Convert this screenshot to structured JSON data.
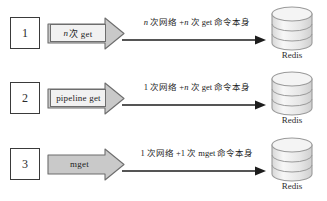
{
  "diagram": {
    "db_label": "Redis",
    "colors": {
      "arrow_fill": "#c9c9c9",
      "arrow_stroke": "#6d6d6d",
      "cylinder_fill": "#eaeaea",
      "cylinder_stroke": "#9a9a9a",
      "line": "#1d1d1d",
      "box_stroke": "#3a3a3a",
      "background": "#ffffff"
    },
    "rows": [
      {
        "number": "1",
        "command_prefix": "n",
        "command_rest": " 次 get",
        "command_full": "n 次 get",
        "boxed_label": true,
        "caption_prefix": "n",
        "caption_mid": " 次网络 +",
        "caption_var": "n",
        "caption_rest": " 次 get 命令本身",
        "caption_full": "n 次网络 +n 次 get 命令本身"
      },
      {
        "number": "2",
        "command_prefix": "",
        "command_rest": "pipeline get",
        "command_full": "pipeline get",
        "boxed_label": true,
        "caption_prefix": "1",
        "caption_mid": " 次网络 +",
        "caption_var": "n",
        "caption_rest": " 次 get 命令本身",
        "caption_full": "1 次网络 +n 次 get 命令本身"
      },
      {
        "number": "3",
        "command_prefix": "",
        "command_rest": "mget",
        "command_full": "mget",
        "boxed_label": false,
        "caption_prefix": "1",
        "caption_mid": " 次网络 +",
        "caption_var": "1",
        "caption_rest": " 次 mget 命令本身",
        "caption_full": "1 次网络 +1 次 mget 命令本身"
      }
    ]
  }
}
